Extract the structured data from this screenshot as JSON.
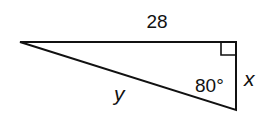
{
  "diagram": {
    "type": "right-triangle",
    "labels": {
      "top_side": "28",
      "right_side": "x",
      "hypotenuse": "y",
      "angle": "80°"
    },
    "right_angle_marker": true,
    "stroke_color": "#111111"
  }
}
